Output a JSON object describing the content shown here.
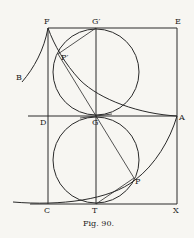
{
  "figure": {
    "caption": "Fig. 90.",
    "labels": {
      "F": "F",
      "G_prime": "G′",
      "E": "E",
      "B": "B",
      "P_prime": "P′",
      "D": "D",
      "G": "G",
      "A": "A",
      "P": "P",
      "C": "C",
      "T": "T",
      "X": "X"
    },
    "colors": {
      "ink": "#2a2a2a",
      "paper": "#f7f6f2"
    }
  }
}
